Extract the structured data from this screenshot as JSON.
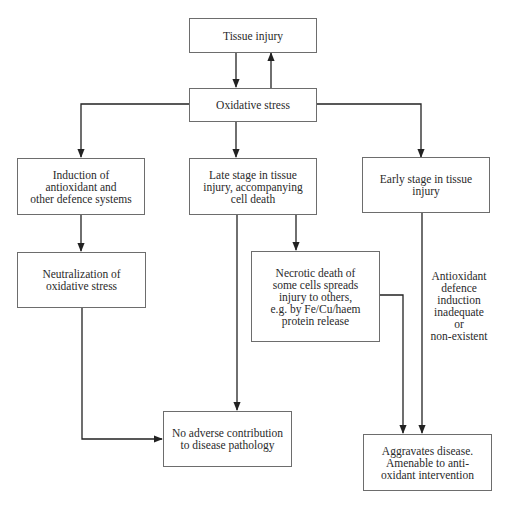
{
  "diagram": {
    "nodes": {
      "tissue_injury": "Tissue injury",
      "oxidative_stress": "Oxidative stress",
      "induction": "Induction of\nantioxidant and\nother defence systems",
      "late_stage": "Late stage in tissue\ninjury, accompanying\ncell death",
      "early_stage": "Early stage in tissue\ninjury",
      "neutralization": "Neutralization of\noxidative stress",
      "necrotic": "Necrotic death of\nsome cells spreads\ninjury to others,\ne.g. by Fe/Cu/haem\nprotein release",
      "no_adverse": "No adverse contribution\nto disease pathology",
      "aggravates": "Aggravates disease.\nAmenable to anti-\noxidant intervention"
    },
    "annotations": {
      "antioxidant_defence": "Antioxidant\ndefence\ninduction\ninadequate or\nnon-existent"
    },
    "edges": [
      {
        "from": "tissue_injury",
        "to": "oxidative_stress"
      },
      {
        "from": "oxidative_stress",
        "to": "tissue_injury"
      },
      {
        "from": "oxidative_stress",
        "to": "induction"
      },
      {
        "from": "oxidative_stress",
        "to": "late_stage"
      },
      {
        "from": "oxidative_stress",
        "to": "early_stage"
      },
      {
        "from": "induction",
        "to": "neutralization"
      },
      {
        "from": "neutralization",
        "to": "no_adverse"
      },
      {
        "from": "late_stage",
        "to": "no_adverse"
      },
      {
        "from": "late_stage",
        "to": "necrotic"
      },
      {
        "from": "necrotic",
        "to": "aggravates"
      },
      {
        "from": "early_stage",
        "to": "aggravates",
        "label": "antioxidant_defence"
      }
    ]
  }
}
